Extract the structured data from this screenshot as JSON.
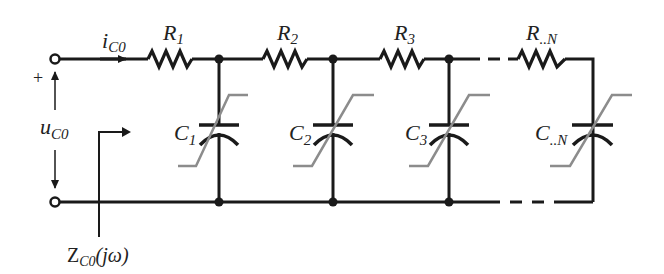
{
  "diagram": {
    "type": "RC ladder network with nonlinear (voltage-dependent) capacitors",
    "colors": {
      "wire": "#1a1a1a",
      "characteristic": "#8c8c8c",
      "background": "#ffffff"
    },
    "input": {
      "current_label": "i",
      "current_sub": "C0",
      "voltage_label": "u",
      "voltage_sub": "C0",
      "plus_sign": "+",
      "impedance_label": "Z",
      "impedance_sub": "C0",
      "impedance_arg": "(jω)"
    },
    "resistors": [
      {
        "label": "R",
        "sub": "1"
      },
      {
        "label": "R",
        "sub": "2"
      },
      {
        "label": "R",
        "sub": "3"
      },
      {
        "label": "R",
        "sub": "..N"
      }
    ],
    "capacitors": [
      {
        "label": "C",
        "sub": "1"
      },
      {
        "label": "C",
        "sub": "2"
      },
      {
        "label": "C",
        "sub": "3"
      },
      {
        "label": "C",
        "sub": "..N"
      }
    ]
  }
}
